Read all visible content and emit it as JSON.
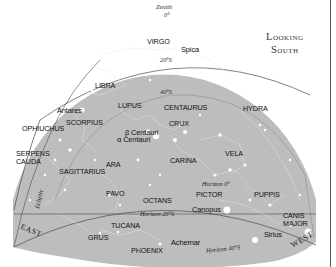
{
  "title": {
    "line1": "Looking",
    "line2": "South"
  },
  "zenith": {
    "label": "Zenith",
    "value": "0°"
  },
  "declination_labels": {
    "d20": "20°S",
    "d40": "40°S"
  },
  "horizon_labels": {
    "h0": "Horizon 0°",
    "h20": "Horizon 20°S",
    "h40": "Horizon 40°S"
  },
  "ecliptic_label": "Ecliptic",
  "directions": {
    "east": "EAST",
    "west": "WEST"
  },
  "constellations": [
    {
      "name": "VIRGO",
      "x": 147,
      "y": 38
    },
    {
      "name": "LIBRA",
      "x": 95,
      "y": 82
    },
    {
      "name": "LUPUS",
      "x": 118,
      "y": 102
    },
    {
      "name": "CENTAURUS",
      "x": 164,
      "y": 104
    },
    {
      "name": "HYDRA",
      "x": 243,
      "y": 105
    },
    {
      "name": "SCORPIUS",
      "x": 66,
      "y": 119
    },
    {
      "name": "CRUX",
      "x": 169,
      "y": 120
    },
    {
      "name": "OPHIUCHUS",
      "x": 22,
      "y": 125
    },
    {
      "name": "SERPENS",
      "x": 16,
      "y": 150
    },
    {
      "name": "CAUDA",
      "x": 16,
      "y": 158
    },
    {
      "name": "ARA",
      "x": 106,
      "y": 161
    },
    {
      "name": "SAGITTARIUS",
      "x": 59,
      "y": 168
    },
    {
      "name": "CARINA",
      "x": 170,
      "y": 157
    },
    {
      "name": "VELA",
      "x": 225,
      "y": 150
    },
    {
      "name": "PAVO",
      "x": 106,
      "y": 190
    },
    {
      "name": "OCTANS",
      "x": 143,
      "y": 197
    },
    {
      "name": "PICTOR",
      "x": 196,
      "y": 191
    },
    {
      "name": "PUPPIS",
      "x": 254,
      "y": 191
    },
    {
      "name": "TUCANA",
      "x": 111,
      "y": 222
    },
    {
      "name": "CANIS",
      "x": 283,
      "y": 212
    },
    {
      "name": "MAJOR",
      "x": 283,
      "y": 220
    },
    {
      "name": "GRUS",
      "x": 88,
      "y": 234
    },
    {
      "name": "PHOENIX",
      "x": 131,
      "y": 247
    }
  ],
  "stars": [
    {
      "name": "Spica",
      "x": 181,
      "y": 46
    },
    {
      "name": "Antares",
      "x": 57,
      "y": 107
    },
    {
      "name": "β Centauri",
      "x": 125,
      "y": 129
    },
    {
      "name": "α Centauri",
      "x": 117,
      "y": 136
    },
    {
      "name": "Canopus",
      "x": 192,
      "y": 206
    },
    {
      "name": "Achernar",
      "x": 171,
      "y": 239
    },
    {
      "name": "Sirius",
      "x": 264,
      "y": 231
    }
  ],
  "colors": {
    "sky": "#bdbdbd",
    "line": "#4a4a4a",
    "star": "#ffffff",
    "background": "#ffffff"
  }
}
